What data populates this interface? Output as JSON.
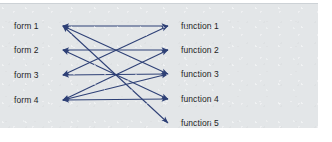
{
  "figure": {
    "type": "bipartite-mapping-diagram",
    "panel_background": "#e3e6e8",
    "edge_color": "#2e4076",
    "label_color": "#1e1e24",
    "left_nodes": [
      {
        "id": "form1",
        "label": "form 1",
        "x": 63,
        "y": 22
      },
      {
        "id": "form2",
        "label": "form 2",
        "x": 63,
        "y": 46
      },
      {
        "id": "form3",
        "label": "form 3",
        "x": 63,
        "y": 71
      },
      {
        "id": "form4",
        "label": "form 4",
        "x": 63,
        "y": 96
      }
    ],
    "right_nodes": [
      {
        "id": "function1",
        "label": "function 1",
        "x": 168,
        "y": 22
      },
      {
        "id": "function2",
        "label": "function 2",
        "x": 168,
        "y": 46
      },
      {
        "id": "function3",
        "label": "function 3",
        "x": 168,
        "y": 70
      },
      {
        "id": "function4",
        "label": "function 4",
        "x": 168,
        "y": 95
      },
      {
        "id": "function5",
        "label": "function 5",
        "x": 168,
        "y": 119
      }
    ],
    "edges": [
      {
        "from": "form1",
        "to": "function1",
        "direction": "both"
      },
      {
        "from": "form1",
        "to": "function3",
        "direction": "both"
      },
      {
        "from": "form1",
        "to": "function5",
        "direction": "both"
      },
      {
        "from": "form2",
        "to": "function2",
        "direction": "both"
      },
      {
        "from": "form2",
        "to": "function4",
        "direction": "both"
      },
      {
        "from": "form3",
        "to": "function1",
        "direction": "both"
      },
      {
        "from": "form3",
        "to": "function3",
        "direction": "both"
      },
      {
        "from": "form4",
        "to": "function2",
        "direction": "both"
      },
      {
        "from": "form4",
        "to": "function3",
        "direction": "both"
      },
      {
        "from": "form4",
        "to": "function4",
        "direction": "both"
      }
    ]
  }
}
